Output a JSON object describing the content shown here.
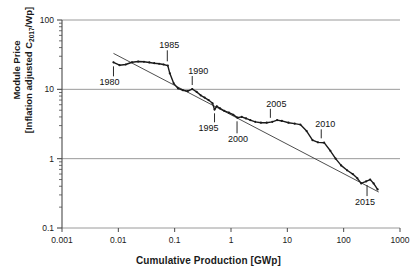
{
  "chart_data": {
    "type": "line",
    "title": "",
    "xlabel": "Cumulative Production [GWp]",
    "ylabel_line1": "Module Price",
    "ylabel_line2_pre": "[Inflation adjusted  C",
    "ylabel_line2_sub": "2017",
    "ylabel_line2_post": "/Wp]",
    "ylabel_full": "Module Price [Inflation adjusted C2017/Wp]",
    "xscale": "log",
    "yscale": "log",
    "xlim": [
      0.001,
      1000
    ],
    "ylim": [
      0.1,
      100
    ],
    "grid": "horizontal-major",
    "legend": "none",
    "xticks": [
      "0.001",
      "0.01",
      "0.1",
      "1",
      "10",
      "100",
      "1000"
    ],
    "xtick_values": [
      0.001,
      0.01,
      0.1,
      1,
      10,
      100,
      1000
    ],
    "yticks": [
      "100",
      "10",
      "1",
      "0.1"
    ],
    "ytick_values": [
      100,
      10,
      1,
      0.1
    ],
    "series": [
      {
        "name": "Module price history",
        "style": "solid-dark-with-markers",
        "color": "#1a1a1a",
        "points": [
          [
            0.0082,
            24.5
          ],
          [
            0.0105,
            22.3
          ],
          [
            0.0135,
            22.8
          ],
          [
            0.0175,
            24.6
          ],
          [
            0.0225,
            25.2
          ],
          [
            0.0285,
            25.0
          ],
          [
            0.0355,
            24.4
          ],
          [
            0.0435,
            23.8
          ],
          [
            0.053,
            23.4
          ],
          [
            0.0635,
            22.8
          ],
          [
            0.0755,
            22.0
          ],
          [
            0.082,
            17.0
          ],
          [
            0.096,
            12.2
          ],
          [
            0.115,
            10.3
          ],
          [
            0.14,
            9.7
          ],
          [
            0.17,
            9.4
          ],
          [
            0.205,
            10.1
          ],
          [
            0.245,
            9.2
          ],
          [
            0.29,
            8.2
          ],
          [
            0.34,
            7.6
          ],
          [
            0.4,
            7.0
          ],
          [
            0.47,
            6.3
          ],
          [
            0.51,
            5.1
          ],
          [
            0.56,
            5.7
          ],
          [
            0.64,
            5.3
          ],
          [
            0.76,
            4.9
          ],
          [
            0.92,
            4.6
          ],
          [
            1.1,
            4.3
          ],
          [
            1.3,
            3.9
          ],
          [
            1.55,
            4.0
          ],
          [
            1.85,
            3.8
          ],
          [
            2.2,
            3.6
          ],
          [
            2.7,
            3.4
          ],
          [
            3.4,
            3.3
          ],
          [
            4.3,
            3.3
          ],
          [
            5.4,
            3.4
          ],
          [
            6.6,
            3.6
          ],
          [
            8.0,
            3.5
          ],
          [
            10.5,
            3.3
          ],
          [
            13.5,
            3.2
          ],
          [
            17.0,
            3.1
          ],
          [
            22.0,
            2.5
          ],
          [
            28.0,
            1.85
          ],
          [
            35.0,
            1.72
          ],
          [
            45.0,
            1.7
          ],
          [
            58.0,
            1.3
          ],
          [
            72.0,
            1.0
          ],
          [
            90.0,
            0.8
          ],
          [
            115.0,
            0.68
          ],
          [
            145.0,
            0.6
          ],
          [
            175.0,
            0.52
          ],
          [
            205.0,
            0.44
          ],
          [
            250.0,
            0.47
          ],
          [
            295.0,
            0.5
          ],
          [
            340.0,
            0.44
          ],
          [
            400.0,
            0.36
          ]
        ]
      },
      {
        "name": "Learning curve trend line",
        "style": "thin-straight",
        "color": "#3a3a3a",
        "points": [
          [
            0.0082,
            33.0
          ],
          [
            420.0,
            0.33
          ]
        ]
      }
    ],
    "annotations": [
      {
        "label": "1980",
        "x": 0.0082,
        "y": 24.5,
        "text_dx": -4,
        "text_dy": 30,
        "tick_len": 10
      },
      {
        "label": "1985",
        "x": 0.074,
        "y": 22.2,
        "text_dx": 2,
        "text_dy": -20,
        "tick_len": 11
      },
      {
        "label": "1990",
        "x": 0.205,
        "y": 10.1,
        "text_dx": 6,
        "text_dy": -18,
        "tick_len": 9
      },
      {
        "label": "1995",
        "x": 0.51,
        "y": 5.15,
        "text_dx": -6,
        "text_dy": 26,
        "tick_len": 9
      },
      {
        "label": "2000",
        "x": 1.28,
        "y": 3.95,
        "text_dx": 1,
        "text_dy": 32,
        "tick_len": 12
      },
      {
        "label": "2005",
        "x": 5.0,
        "y": 3.4,
        "text_dx": 6,
        "text_dy": -18,
        "tick_len": 9
      },
      {
        "label": "2010",
        "x": 40.0,
        "y": 1.72,
        "text_dx": 4,
        "text_dy": -18,
        "tick_len": 9
      },
      {
        "label": "2015",
        "x": 260.0,
        "y": 0.475,
        "text_dx": -2,
        "text_dy": 28,
        "tick_len": 11
      }
    ]
  },
  "figure": {
    "background_color": "#ffffff",
    "gridline_color": "#9a9a9a",
    "axis_color": "#4a4a4a",
    "text_color": "#1a1a1a"
  }
}
